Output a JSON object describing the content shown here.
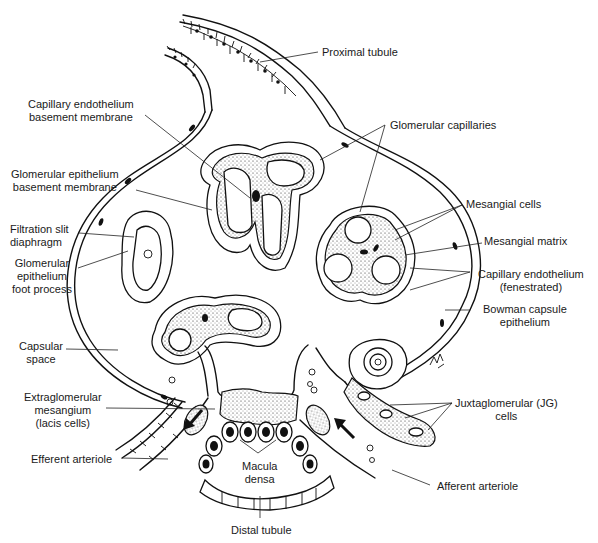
{
  "diagram": {
    "colors": {
      "ink": "#111111",
      "background": "#ffffff"
    },
    "labels": {
      "proximal_tubule": "Proximal tubule",
      "capillary_endothelium_bm": "Capillary endothelium\nbasement membrane",
      "glomerular_capillaries": "Glomerular capillaries",
      "glomerular_epithelium_bm": "Glomerular epithelium\nbasement membrane",
      "mesangial_cells": "Mesangial cells",
      "filtration_slit": "Filtration slit\ndiaphragm",
      "mesangial_matrix": "Mesangial matrix",
      "foot_process": "Glomerular\nepithelium\nfoot process",
      "capillary_endothelium_fen": "Capillary endothelium\n(fenestrated)",
      "bowman_capsule": "Bowman capsule\nepithelium",
      "capsular_space": "Capsular\nspace",
      "extraglomerular_mesangium": "Extraglomerular\nmesangium\n(lacis cells)",
      "jg_cells": "Juxtaglomerular (JG)\ncells",
      "efferent_arteriole": "Efferent arteriole",
      "macula_densa": "Macula\ndensa",
      "afferent_arteriole": "Afferent arteriole",
      "distal_tubule": "Distal tubule"
    },
    "flow_arrows": [
      {
        "name": "efferent-flow",
        "direction": "out (down-left)"
      },
      {
        "name": "afferent-flow",
        "direction": "in (up-left)"
      }
    ]
  }
}
